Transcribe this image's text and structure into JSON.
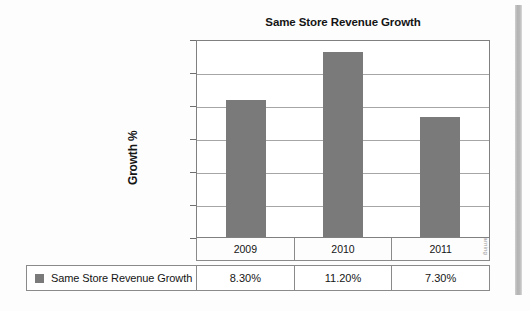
{
  "chart_data": {
    "type": "bar",
    "title": "Same Store Revenue Growth",
    "xlabel": "",
    "ylabel": "Growth %",
    "categories": [
      "2009",
      "2010",
      "2011"
    ],
    "values": [
      8.3,
      11.2,
      7.3
    ],
    "value_labels": [
      "8.30%",
      "11.20%",
      "7.30%"
    ],
    "series": [
      {
        "name": "Same Store Revenue Growth",
        "values": [
          8.3,
          11.2,
          7.3
        ],
        "color": "#7a7a7a"
      }
    ],
    "ylim": [
      0,
      12
    ],
    "ytick_values": [
      0,
      2,
      4,
      6,
      8,
      10,
      12
    ],
    "ytick_labels": [
      "0.00%",
      "2.00%",
      "4.00%",
      "6.00%",
      "8.00%",
      "10.00%",
      "12.00%"
    ],
    "grid": true,
    "legend_position": "bottom-table"
  },
  "legend": {
    "label": "Same Store Revenue Growth",
    "swatch_color": "#7a7a7a"
  },
  "credit": {
    "text": "© Cengage Learning"
  }
}
